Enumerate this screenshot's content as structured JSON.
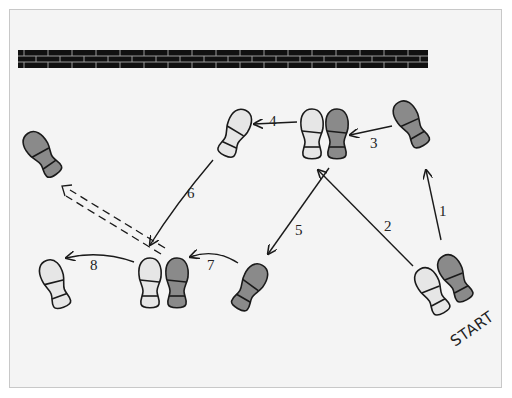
{
  "diagram": {
    "wall": {
      "label": "wall",
      "color": "#111111",
      "mortar": "#9a9a9a"
    },
    "colors": {
      "left_foot": "#e6e6e6",
      "right_foot": "#8a8a8a",
      "outline": "#1a1a1a",
      "background": "#f4f4f4"
    },
    "start_label": "START",
    "steps": [
      {
        "number": "1",
        "label": "1",
        "foot": "right"
      },
      {
        "number": "2",
        "label": "2",
        "foot": "left"
      },
      {
        "number": "3",
        "label": "3",
        "foot": "right"
      },
      {
        "number": "4",
        "label": "4",
        "foot": "left"
      },
      {
        "number": "5",
        "label": "5",
        "foot": "right"
      },
      {
        "number": "6",
        "label": "6",
        "foot": "left"
      },
      {
        "number": "7",
        "label": "7",
        "foot": "right"
      },
      {
        "number": "8",
        "label": "8",
        "foot": "left"
      }
    ],
    "dashed_arrow": {
      "description": "optional step from pair 6/7 to upper-left right foot"
    }
  }
}
